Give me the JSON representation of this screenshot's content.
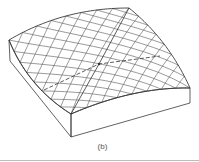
{
  "figure": {
    "caption": "(b)",
    "colors": {
      "line": "#3a3a3a",
      "grid": "#555555",
      "caption": "#555555",
      "rule": "#bdbdbd"
    },
    "corners": {
      "left_top": [
        9,
        40
      ],
      "back_top": [
        129,
        8
      ],
      "right_top": [
        190,
        88
      ],
      "front_top": [
        71,
        114
      ],
      "left_bottom": [
        10,
        61
      ],
      "front_bottom": [
        71,
        137
      ],
      "right_bottom": [
        190,
        103
      ]
    },
    "edge_midpoints": {
      "back_left": [
        66,
        16
      ],
      "back_right": [
        164,
        44
      ],
      "front_right": [
        132,
        94
      ],
      "front_left": [
        34,
        82
      ]
    },
    "center": [
      99,
      64
    ],
    "grid_divisions": 8,
    "dashed_line": [
      [
        44,
        90
      ],
      [
        99,
        64
      ],
      [
        160,
        56
      ]
    ],
    "solid_diagonal": [
      [
        129,
        8
      ],
      [
        99,
        64
      ],
      [
        71,
        114
      ]
    ]
  }
}
